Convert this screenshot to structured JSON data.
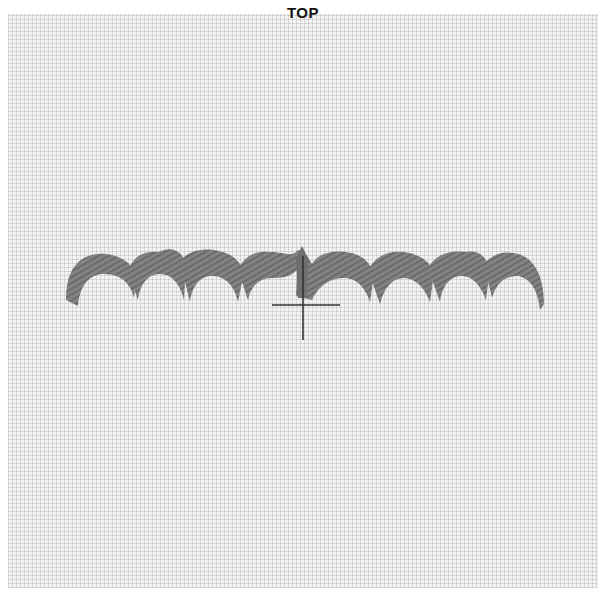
{
  "label": {
    "text": "TOP"
  },
  "embroidery": {
    "stitch_type": "scallop-satin-stitch",
    "scallop_count": 8,
    "thread_color": "#7a7a7a",
    "fabric_color": "#f3f3f3"
  },
  "marker": {
    "type": "crosshair",
    "color": "#333333"
  }
}
